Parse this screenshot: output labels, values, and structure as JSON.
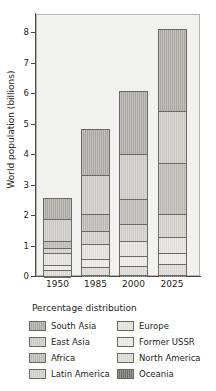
{
  "chart_data": {
    "type": "bar",
    "stacked": true,
    "title": "",
    "xlabel": "",
    "ylabel": "World population (billions)",
    "categories": [
      "1950",
      "1985",
      "2000",
      "2025"
    ],
    "ylim": [
      0,
      8.6
    ],
    "yticks": [
      0,
      1,
      2,
      3,
      4,
      5,
      6,
      7,
      8
    ],
    "ytick_labels": [
      "0",
      "1",
      "2",
      "3",
      "4",
      "5",
      "6",
      "7",
      "8"
    ],
    "grid": false,
    "legend_position": "below",
    "legend_title": "Percentage distribution",
    "totals": [
      2.56,
      4.82,
      6.08,
      8.12
    ],
    "series": [
      {
        "name": "Oceania",
        "color": "#6e6c69",
        "values": [
          0.013,
          0.025,
          0.03,
          0.041
        ]
      },
      {
        "name": "North America",
        "color": "#d9d7d2",
        "values": [
          0.166,
          0.264,
          0.306,
          0.364
        ]
      },
      {
        "name": "Former USSR",
        "color": "#e8e6e2",
        "values": [
          0.18,
          0.278,
          0.31,
          0.352
        ]
      },
      {
        "name": "Europe",
        "color": "#e0ded9",
        "values": [
          0.393,
          0.492,
          0.51,
          0.515
        ]
      },
      {
        "name": "Latin America",
        "color": "#cdcbc6",
        "values": [
          0.165,
          0.405,
          0.54,
          0.757
        ]
      },
      {
        "name": "Africa",
        "color": "#b8b6b1",
        "values": [
          0.222,
          0.555,
          0.832,
          1.67
        ]
      },
      {
        "name": "East Asia",
        "color": "#c9c7c2",
        "values": [
          0.723,
          1.31,
          1.48,
          1.72
        ]
      },
      {
        "name": "South Asia",
        "color": "#a8a6a1",
        "values": [
          0.698,
          1.491,
          2.072,
          2.701
        ]
      }
    ],
    "annotations": []
  },
  "legend": {
    "title": "Percentage distribution",
    "items": [
      {
        "label": "South Asia",
        "color": "#a8a6a1"
      },
      {
        "label": "Europe",
        "color": "#e0ded9"
      },
      {
        "label": "East Asia",
        "color": "#c9c7c2"
      },
      {
        "label": "Former USSR",
        "color": "#e8e6e2"
      },
      {
        "label": "Africa",
        "color": "#b8b6b1"
      },
      {
        "label": "North America",
        "color": "#d9d7d2"
      },
      {
        "label": "Latin America",
        "color": "#cdcbc6"
      },
      {
        "label": "Oceania",
        "color": "#6e6c69"
      }
    ]
  }
}
